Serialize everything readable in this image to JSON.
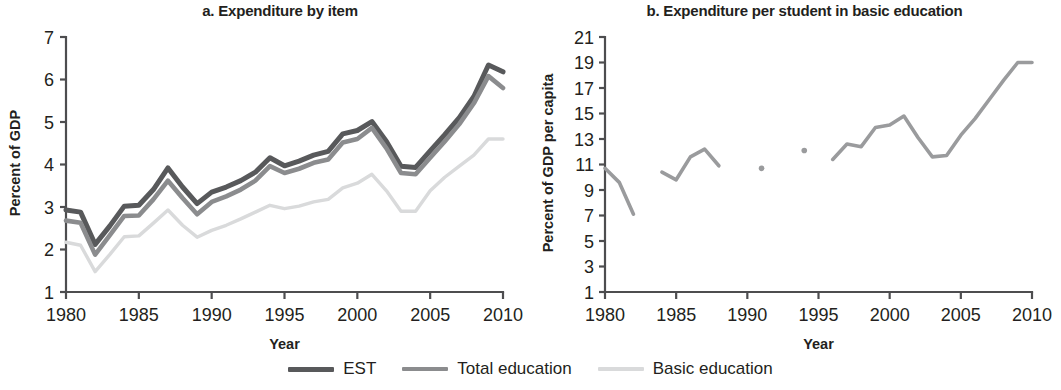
{
  "figure": {
    "legend": {
      "items": [
        {
          "label": "EST",
          "color": "#58595b",
          "width": 5.0
        },
        {
          "label": "Total education",
          "color": "#8b8c8e",
          "width": 4.6
        },
        {
          "label": "Basic education",
          "color": "#d9dadb",
          "width": 3.4
        }
      ]
    }
  },
  "chart_data": [
    {
      "id": "a",
      "type": "line",
      "title": "a. Expenditure by item",
      "xlabel": "Year",
      "ylabel": "Percent of GDP",
      "xlim": [
        1980,
        2010
      ],
      "ylim": [
        1,
        7
      ],
      "xticks": [
        1980,
        1985,
        1990,
        1995,
        2000,
        2005,
        2010
      ],
      "xtick_labels": [
        "1980",
        "1985",
        "1990",
        "1995",
        "2000",
        "2005",
        "2010"
      ],
      "yticks": [
        1,
        2,
        3,
        4,
        5,
        6,
        7
      ],
      "ytick_labels": [
        "1",
        "2",
        "3",
        "4",
        "5",
        "6",
        "7"
      ],
      "grid": false,
      "legend_position": "below-figure",
      "x": [
        1980,
        1981,
        1982,
        1983,
        1984,
        1985,
        1986,
        1987,
        1988,
        1989,
        1990,
        1991,
        1992,
        1993,
        1994,
        1995,
        1996,
        1997,
        1998,
        1999,
        2000,
        2001,
        2002,
        2003,
        2004,
        2005,
        2006,
        2007,
        2008,
        2009,
        2010
      ],
      "series": [
        {
          "name": "EST",
          "color": "#58595b",
          "width": 5.0,
          "values": [
            2.93,
            2.88,
            2.12,
            2.55,
            3.02,
            3.04,
            3.41,
            3.92,
            3.47,
            3.08,
            3.35,
            3.47,
            3.62,
            3.82,
            4.16,
            3.97,
            4.08,
            4.22,
            4.31,
            4.72,
            4.8,
            5.01,
            4.54,
            3.96,
            3.93,
            4.32,
            4.7,
            5.1,
            5.6,
            6.34,
            6.18
          ]
        },
        {
          "name": "Total education",
          "color": "#8b8c8e",
          "width": 4.6,
          "values": [
            2.68,
            2.63,
            1.88,
            2.33,
            2.79,
            2.8,
            3.18,
            3.62,
            3.21,
            2.83,
            3.12,
            3.25,
            3.41,
            3.62,
            3.96,
            3.8,
            3.9,
            4.04,
            4.12,
            4.52,
            4.6,
            4.86,
            4.38,
            3.8,
            3.77,
            4.16,
            4.54,
            4.95,
            5.44,
            6.08,
            5.8
          ]
        },
        {
          "name": "Basic education",
          "color": "#d9dadb",
          "width": 3.4,
          "values": [
            2.17,
            2.1,
            1.48,
            1.88,
            2.3,
            2.32,
            2.62,
            2.93,
            2.57,
            2.29,
            2.45,
            2.57,
            2.72,
            2.88,
            3.04,
            2.96,
            3.02,
            3.12,
            3.18,
            3.45,
            3.56,
            3.77,
            3.38,
            2.9,
            2.9,
            3.38,
            3.7,
            3.96,
            4.22,
            4.6,
            4.6
          ]
        }
      ]
    },
    {
      "id": "b",
      "type": "line",
      "title": "b. Expenditure per student in basic education",
      "xlabel": "Year",
      "ylabel": "Percent of GDP per capita",
      "xlim": [
        1980,
        2010
      ],
      "ylim": [
        1,
        21
      ],
      "xticks": [
        1980,
        1985,
        1990,
        1995,
        2000,
        2005,
        2010
      ],
      "xtick_labels": [
        "1980",
        "1985",
        "1990",
        "1995",
        "2000",
        "2005",
        "2010"
      ],
      "yticks": [
        1,
        3,
        5,
        7,
        9,
        11,
        13,
        15,
        17,
        19,
        21
      ],
      "ytick_labels": [
        "1",
        "3",
        "5",
        "7",
        "9",
        "11",
        "13",
        "15",
        "17",
        "19",
        "21"
      ],
      "grid": false,
      "series": [
        {
          "name": "Basic education per student",
          "color": "#9a9b9d",
          "width": 3.6,
          "segments": [
            {
              "x": [
                1980,
                1981,
                1982
              ],
              "values": [
                10.7,
                9.6,
                7.1
              ]
            },
            {
              "x": [
                1984,
                1985,
                1986,
                1987,
                1988
              ],
              "values": [
                10.4,
                9.8,
                11.6,
                12.2,
                10.9
              ]
            },
            {
              "x": [
                1991
              ],
              "values": [
                10.7
              ]
            },
            {
              "x": [
                1994
              ],
              "values": [
                12.1
              ]
            },
            {
              "x": [
                1996,
                1997,
                1998,
                1999,
                2000,
                2001,
                2002,
                2003,
                2004,
                2005,
                2006,
                2007,
                2008,
                2009,
                2010
              ],
              "values": [
                11.4,
                12.6,
                12.4,
                13.9,
                14.1,
                14.8,
                13.1,
                11.6,
                11.7,
                13.3,
                14.6,
                16.1,
                17.6,
                19.0,
                19.0
              ]
            }
          ]
        }
      ]
    }
  ]
}
